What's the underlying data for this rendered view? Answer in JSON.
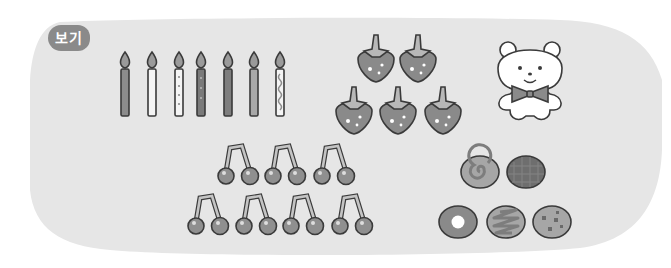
{
  "badge": {
    "label": "보기"
  },
  "colors": {
    "background": "#ffffff",
    "panel": "#e6e6e6",
    "outline": "#3a3a3a",
    "badge": "#8a8a8a",
    "candle_dark": "#8c8c8c",
    "candle_light": "#f4f4f4",
    "flame": "#9a9a9a",
    "strawberry_body": "#8a8a8a",
    "strawberry_leaf": "#b8b8b8",
    "cherry": "#8f8f8f",
    "stem": "#c4c4c4"
  },
  "groups": {
    "candles": {
      "label": "candles",
      "count": 7,
      "styles": [
        "dark-stripes",
        "plain-light",
        "light-dots",
        "dark-dots",
        "dark-plain",
        "medium-plain",
        "light-zigzag"
      ]
    },
    "strawberries": {
      "label": "strawberries",
      "count": 5
    },
    "bear": {
      "label": "teddy bear with bow tie",
      "count": 1
    },
    "cherries": {
      "label": "cherry pairs",
      "count": 7,
      "rows": [
        3,
        4
      ]
    },
    "cookies": {
      "label": "cookies and cakes",
      "count": 5,
      "types": [
        "swirl-roll",
        "checkered-cookie",
        "donut",
        "zigzag-cookie",
        "chip-cookie"
      ]
    }
  }
}
